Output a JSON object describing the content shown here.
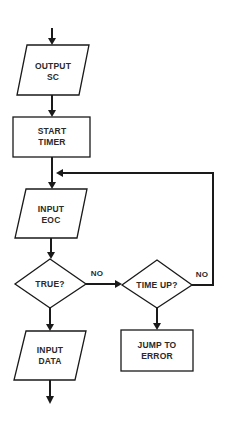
{
  "diagram": {
    "type": "flowchart",
    "nodes": [
      {
        "id": "output_sc",
        "shape": "parallelogram",
        "lines": [
          "OUTPUT",
          "SC"
        ]
      },
      {
        "id": "start_timer",
        "shape": "rectangle",
        "lines": [
          "START",
          "TIMER"
        ]
      },
      {
        "id": "input_eoc",
        "shape": "parallelogram",
        "lines": [
          "INPUT",
          "EOC"
        ]
      },
      {
        "id": "true_q",
        "shape": "diamond",
        "lines": [
          "TRUE?"
        ]
      },
      {
        "id": "time_up_q",
        "shape": "diamond",
        "lines": [
          "TIME UP?"
        ]
      },
      {
        "id": "jump_to_error",
        "shape": "rectangle",
        "lines": [
          "JUMP TO",
          "ERROR"
        ]
      },
      {
        "id": "input_data",
        "shape": "parallelogram",
        "lines": [
          "INPUT",
          "DATA"
        ]
      }
    ],
    "edges": [
      {
        "from": "entry",
        "to": "output_sc",
        "label": ""
      },
      {
        "from": "output_sc",
        "to": "start_timer",
        "label": ""
      },
      {
        "from": "start_timer",
        "to": "input_eoc",
        "label": ""
      },
      {
        "from": "input_eoc",
        "to": "true_q",
        "label": ""
      },
      {
        "from": "true_q",
        "to": "time_up_q",
        "label": "NO"
      },
      {
        "from": "true_q",
        "to": "input_data",
        "label": ""
      },
      {
        "from": "time_up_q",
        "to": "input_eoc",
        "label": "NO"
      },
      {
        "from": "time_up_q",
        "to": "jump_to_error",
        "label": ""
      },
      {
        "from": "input_data",
        "to": "exit",
        "label": ""
      }
    ],
    "edge_labels": {
      "true_no": "NO",
      "timeup_no": "NO"
    }
  }
}
